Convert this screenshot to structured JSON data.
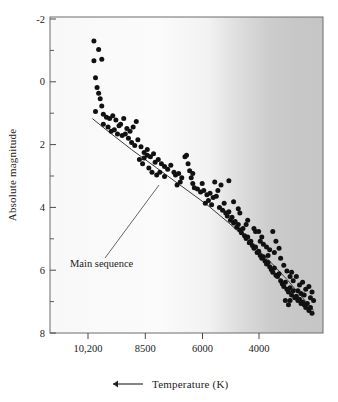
{
  "figure": {
    "type": "scatter",
    "background_color": "#ffffff",
    "plot_frame_color": "#6d6d6d",
    "point_color": "#111111",
    "shade_color": "#c8c8c8"
  },
  "axes": {
    "y": {
      "title": "Absolute magnitude",
      "major_ticks": [
        "-2",
        "0",
        "2",
        "4",
        "6",
        "8"
      ],
      "major_values": [
        -2,
        0,
        2,
        4,
        6,
        8
      ],
      "minor_values": [
        -1,
        1,
        3,
        5,
        7
      ],
      "range": [
        -2.6,
        8.6
      ],
      "direction": "inverted-top-is-brightest"
    },
    "x": {
      "title": "Temperature (K)",
      "arrow": "left-arrow",
      "arrow_glyph": "←",
      "tick_labels": [
        "10,200",
        "8500",
        "6000",
        "4000"
      ],
      "tick_values": [
        10200,
        8500,
        6000,
        4000
      ],
      "range": [
        11600,
        2900
      ],
      "direction": "decreasing-to-the-right"
    }
  },
  "annotations": [
    {
      "name": "main-sequence",
      "label": "Main sequence",
      "leader_line": true
    }
  ],
  "chart_data": {
    "type": "scatter",
    "title": "",
    "subtitle": "",
    "xlabel": "Temperature (K)",
    "ylabel": "Absolute magnitude",
    "xlim": [
      11600,
      2900
    ],
    "ylim": [
      8.6,
      -2.6
    ],
    "x_inverted": true,
    "y_inverted": true,
    "grid": false,
    "legend": null,
    "xticks": [
      10200,
      8500,
      6000,
      4000
    ],
    "xticklabels": [
      "10,200",
      "8500",
      "6000",
      "4000"
    ],
    "yticks": [
      -2,
      0,
      2,
      4,
      6,
      8
    ],
    "yticklabels": [
      "-2",
      "0",
      "2",
      "4",
      "6",
      "8"
    ],
    "y_minor_ticks": [
      -1,
      1,
      3,
      5,
      7
    ],
    "annotations": [
      {
        "text": "Main sequence",
        "x": 9000,
        "y": 5.6,
        "points_to_x": 7650,
        "points_to_y": 3.3
      }
    ],
    "shaded_band": {
      "description": "gray shading toward cool temperatures",
      "start_temperature": 5250,
      "full_temperature": 4600,
      "color": "#c8c8c8"
    },
    "main_sequence_line": {
      "label": "Main sequence",
      "x": [
        10250,
        9750,
        9000,
        8200,
        7400,
        6600,
        5900,
        5200,
        4600,
        4050,
        3550,
        3200
      ],
      "y": [
        1.0,
        1.45,
        2.1,
        2.75,
        3.4,
        4.05,
        4.7,
        5.4,
        6.05,
        6.7,
        7.35,
        7.8
      ]
    },
    "series": [
      {
        "name": "Stars",
        "marker": "filled-circle",
        "color": "#111111",
        "points": [
          [
            10200,
            -1.75
          ],
          [
            10050,
            -1.45
          ],
          [
            9950,
            -1.1
          ],
          [
            10200,
            -1.05
          ],
          [
            10150,
            -0.45
          ],
          [
            10100,
            -0.1
          ],
          [
            10050,
            0.1
          ],
          [
            10000,
            0.3
          ],
          [
            9950,
            0.55
          ],
          [
            10150,
            0.75
          ],
          [
            9900,
            0.85
          ],
          [
            9800,
            0.95
          ],
          [
            9700,
            1.0
          ],
          [
            9600,
            0.9
          ],
          [
            9500,
            1.05
          ],
          [
            9400,
            1.25
          ],
          [
            9350,
            1.2
          ],
          [
            9250,
            1.0
          ],
          [
            9150,
            1.35
          ],
          [
            9900,
            1.2
          ],
          [
            9750,
            1.3
          ],
          [
            9650,
            1.45
          ],
          [
            9550,
            1.4
          ],
          [
            9450,
            1.55
          ],
          [
            9300,
            1.6
          ],
          [
            9200,
            1.55
          ],
          [
            9100,
            1.7
          ],
          [
            9050,
            1.45
          ],
          [
            8950,
            1.3
          ],
          [
            8850,
            1.1
          ],
          [
            9000,
            1.85
          ],
          [
            8900,
            1.95
          ],
          [
            8800,
            1.75
          ],
          [
            8700,
            2.0
          ],
          [
            8600,
            2.2
          ],
          [
            8500,
            2.1
          ],
          [
            8400,
            2.35
          ],
          [
            8300,
            2.25
          ],
          [
            8250,
            2.55
          ],
          [
            8150,
            2.45
          ],
          [
            8050,
            2.6
          ],
          [
            7950,
            2.7
          ],
          [
            7850,
            2.8
          ],
          [
            7750,
            2.65
          ],
          [
            7650,
            2.9
          ],
          [
            7600,
            3.0
          ],
          [
            7500,
            2.95
          ],
          [
            7400,
            3.1
          ],
          [
            8600,
            2.4
          ],
          [
            8450,
            2.75
          ],
          [
            8350,
            2.9
          ],
          [
            8200,
            3.0
          ],
          [
            8100,
            2.9
          ],
          [
            7950,
            3.05
          ],
          [
            8500,
            2.3
          ],
          [
            8750,
            2.45
          ],
          [
            8650,
            2.6
          ],
          [
            7300,
            2.35
          ],
          [
            7250,
            2.3
          ],
          [
            7200,
            2.6
          ],
          [
            7150,
            2.85
          ],
          [
            7100,
            3.1
          ],
          [
            7050,
            3.3
          ],
          [
            7000,
            3.45
          ],
          [
            6900,
            3.5
          ],
          [
            6800,
            3.6
          ],
          [
            6700,
            3.55
          ],
          [
            6600,
            3.7
          ],
          [
            6500,
            3.65
          ],
          [
            6400,
            3.8
          ],
          [
            6300,
            3.75
          ],
          [
            6250,
            3.55
          ],
          [
            6200,
            4.15
          ],
          [
            6100,
            4.25
          ],
          [
            6050,
            4.0
          ],
          [
            6000,
            4.35
          ],
          [
            5950,
            4.45
          ],
          [
            5900,
            4.3
          ],
          [
            5850,
            4.6
          ],
          [
            5800,
            4.5
          ],
          [
            5750,
            4.7
          ],
          [
            5700,
            4.65
          ],
          [
            5650,
            4.85
          ],
          [
            5600,
            4.75
          ],
          [
            5550,
            4.95
          ],
          [
            5500,
            5.05
          ],
          [
            5450,
            4.9
          ],
          [
            5400,
            5.15
          ],
          [
            5350,
            5.25
          ],
          [
            5300,
            5.2
          ],
          [
            5250,
            5.4
          ],
          [
            5200,
            5.35
          ],
          [
            5150,
            5.5
          ],
          [
            5100,
            5.6
          ],
          [
            5050,
            5.55
          ],
          [
            5000,
            5.75
          ],
          [
            4950,
            5.7
          ],
          [
            4900,
            5.85
          ],
          [
            4850,
            5.95
          ],
          [
            4800,
            5.9
          ],
          [
            4750,
            6.05
          ],
          [
            4700,
            6.15
          ],
          [
            4650,
            6.1
          ],
          [
            4600,
            6.25
          ],
          [
            6350,
            3.25
          ],
          [
            6150,
            3.35
          ],
          [
            5900,
            3.2
          ],
          [
            6450,
            4.05
          ],
          [
            5750,
            3.95
          ],
          [
            5600,
            4.2
          ],
          [
            5300,
            4.6
          ],
          [
            5550,
            4.35
          ],
          [
            4950,
            5.0
          ],
          [
            4850,
            5.2
          ],
          [
            4800,
            5.45
          ],
          [
            5050,
            5.0
          ],
          [
            4900,
            5.35
          ],
          [
            4700,
            5.55
          ],
          [
            4650,
            5.85
          ],
          [
            4600,
            5.65
          ],
          [
            4550,
            6.35
          ],
          [
            4500,
            6.45
          ],
          [
            4450,
            6.3
          ],
          [
            4400,
            6.55
          ],
          [
            4350,
            6.6
          ],
          [
            4300,
            6.5
          ],
          [
            4250,
            6.75
          ],
          [
            4200,
            6.85
          ],
          [
            4150,
            6.95
          ],
          [
            4100,
            6.8
          ],
          [
            4050,
            7.05
          ],
          [
            4000,
            7.15
          ],
          [
            3950,
            7.0
          ],
          [
            3900,
            7.25
          ],
          [
            3850,
            7.1
          ],
          [
            3800,
            7.35
          ],
          [
            3750,
            7.3
          ],
          [
            3700,
            7.45
          ],
          [
            3650,
            7.4
          ],
          [
            3600,
            7.55
          ],
          [
            3550,
            7.5
          ],
          [
            3500,
            7.6
          ],
          [
            3450,
            7.7
          ],
          [
            3400,
            7.55
          ],
          [
            3350,
            7.8
          ],
          [
            3300,
            7.7
          ],
          [
            3250,
            7.9
          ],
          [
            4500,
            5.0
          ],
          [
            4400,
            5.35
          ],
          [
            4300,
            5.6
          ],
          [
            4250,
            5.95
          ],
          [
            4150,
            6.2
          ],
          [
            4450,
            5.75
          ],
          [
            4050,
            6.4
          ],
          [
            3950,
            6.6
          ],
          [
            3850,
            6.75
          ],
          [
            3750,
            6.6
          ],
          [
            3650,
            6.9
          ],
          [
            3550,
            6.8
          ],
          [
            3450,
            7.05
          ],
          [
            3350,
            6.95
          ],
          [
            3900,
            6.45
          ],
          [
            3700,
            7.1
          ],
          [
            3600,
            7.2
          ],
          [
            3500,
            7.25
          ],
          [
            3300,
            7.35
          ],
          [
            3250,
            7.15
          ],
          [
            3200,
            7.45
          ],
          [
            4100,
            7.45
          ],
          [
            4000,
            7.6
          ],
          [
            3950,
            7.45
          ],
          [
            5100,
            4.9
          ],
          [
            5350,
            4.75
          ],
          [
            6550,
            3.9
          ],
          [
            6650,
            4.0
          ],
          [
            6750,
            3.3
          ],
          [
            7050,
            2.95
          ],
          [
            7450,
            3.25
          ],
          [
            7550,
            3.35
          ]
        ]
      }
    ]
  }
}
